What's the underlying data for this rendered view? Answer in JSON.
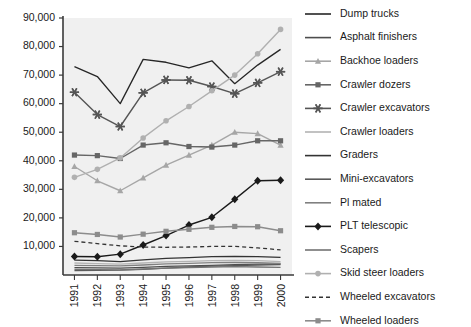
{
  "chart_data": {
    "type": "line",
    "title": "",
    "subtitle": "",
    "xlabel": "",
    "ylabel": "",
    "grid": false,
    "legend_position": "right",
    "x": [
      "1991",
      "1992",
      "1993",
      "1994",
      "1995",
      "1996",
      "1997",
      "1998",
      "1999",
      "2000"
    ],
    "categories": [
      "1991",
      "1992",
      "1993",
      "1994",
      "1995",
      "1996",
      "1997",
      "1998",
      "1999",
      "2000"
    ],
    "ylim": [
      0,
      90000
    ],
    "yticks": [
      10000,
      20000,
      30000,
      40000,
      50000,
      60000,
      70000,
      80000,
      90000
    ],
    "ytick_labels": [
      "10,000",
      "20,000",
      "30,000",
      "40,000",
      "50,000",
      "60,000",
      "70,000",
      "80,000",
      "90,000"
    ],
    "series": [
      {
        "name": "Dump trucks",
        "marker": "none",
        "dash": false,
        "color": "#262626",
        "values": [
          73000,
          69500,
          60000,
          75500,
          74500,
          72500,
          75000,
          67000,
          73500,
          79000
        ]
      },
      {
        "name": "Asphalt finishers",
        "marker": "none",
        "dash": false,
        "color": "#4d4d4d",
        "values": [
          2600,
          2500,
          2400,
          2700,
          3000,
          3200,
          3400,
          3600,
          3800,
          3900
        ]
      },
      {
        "name": "Backhoe loaders",
        "marker": "triangle",
        "dash": false,
        "color": "#a6a6a6",
        "values": [
          38000,
          33000,
          29500,
          34000,
          38500,
          42000,
          45500,
          50000,
          49500,
          45500
        ]
      },
      {
        "name": "Crawler dozers",
        "marker": "square",
        "dash": false,
        "color": "#666666",
        "values": [
          42000,
          41800,
          40800,
          45500,
          46300,
          45000,
          44800,
          45500,
          47000,
          47000
        ]
      },
      {
        "name": "Crawler excavators",
        "marker": "asterisk",
        "dash": false,
        "color": "#555555",
        "values": [
          64000,
          56200,
          52000,
          63800,
          68300,
          68200,
          66000,
          63500,
          67300,
          71200
        ]
      },
      {
        "name": "Crawler loaders",
        "marker": "none",
        "dash": false,
        "color": "#b3b3b3",
        "values": [
          4200,
          4000,
          3800,
          4200,
          4600,
          4800,
          5000,
          5100,
          5000,
          4700
        ]
      },
      {
        "name": "Graders",
        "marker": "none",
        "dash": false,
        "color": "#333333",
        "values": [
          5200,
          5000,
          4700,
          5300,
          5800,
          6100,
          6400,
          6500,
          6400,
          6200
        ]
      },
      {
        "name": "Mini-excavators",
        "marker": "none",
        "dash": false,
        "color": "#595959",
        "values": [
          1500,
          1600,
          1700,
          2000,
          2400,
          2800,
          3100,
          3300,
          3500,
          3600
        ]
      },
      {
        "name": "Pl mated",
        "marker": "none",
        "dash": false,
        "color": "#808080",
        "values": [
          3400,
          3300,
          3200,
          3500,
          3900,
          4100,
          4300,
          4400,
          4300,
          4100
        ]
      },
      {
        "name": "PLT telescopic",
        "marker": "diamond",
        "dash": false,
        "color": "#1a1a1a",
        "values": [
          6500,
          6400,
          7300,
          10500,
          13800,
          17500,
          20200,
          26500,
          33000,
          33200
        ]
      },
      {
        "name": "Scapers",
        "marker": "none",
        "dash": false,
        "color": "#737373",
        "values": [
          2000,
          1900,
          1800,
          2100,
          2400,
          2600,
          2800,
          2900,
          2800,
          2700
        ]
      },
      {
        "name": "Skid steer loaders",
        "marker": "circle",
        "dash": false,
        "color": "#b0b0b0",
        "values": [
          34200,
          37000,
          41000,
          48000,
          54000,
          59000,
          64500,
          70000,
          77500,
          86000
        ]
      },
      {
        "name": "Wheeled excavators",
        "marker": "none",
        "dash": true,
        "color": "#333333",
        "values": [
          11800,
          11000,
          10200,
          9800,
          9700,
          9800,
          10000,
          10000,
          9500,
          8800
        ]
      },
      {
        "name": "Wheeled loaders",
        "marker": "square",
        "dash": false,
        "color": "#8c8c8c",
        "values": [
          14800,
          14200,
          13300,
          14300,
          15300,
          16000,
          16700,
          17000,
          16900,
          15500
        ]
      }
    ]
  },
  "plot": {
    "background_color": "#f0f0f0",
    "axis_color": "#3a3a3a"
  }
}
